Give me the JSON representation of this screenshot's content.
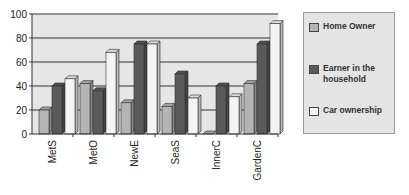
{
  "chart_data": {
    "type": "bar",
    "style": "3d-clustered-column",
    "title": "",
    "xlabel": "",
    "ylabel": "",
    "categories": [
      "MetS",
      "MetO",
      "NewE",
      "SeaS",
      "InnerC",
      "GardenC"
    ],
    "series": [
      {
        "name": "Home Owner",
        "color": "#b4b4b4",
        "values": [
          20,
          42,
          26,
          23,
          0,
          42
        ]
      },
      {
        "name": "Earner in the household",
        "color": "#5a5a5a",
        "values": [
          40,
          36,
          75,
          50,
          40,
          75
        ]
      },
      {
        "name": "Car ownership",
        "color": "#f4f4f4",
        "values": [
          46,
          68,
          75,
          30,
          31,
          92
        ]
      }
    ],
    "ylim": [
      0,
      100
    ],
    "yticks": [
      0,
      20,
      40,
      60,
      80,
      100
    ],
    "grid": true,
    "legend_position": "right"
  },
  "legend": {
    "items": [
      {
        "label": "Home Owner",
        "color": "#b4b4b4"
      },
      {
        "label": "Earner in the household",
        "color": "#5a5a5a"
      },
      {
        "label": "Car ownership",
        "color": "#f4f4f4"
      }
    ]
  }
}
